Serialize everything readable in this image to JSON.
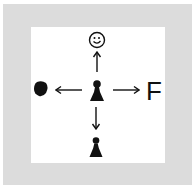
{
  "diagram": {
    "background_frame_color": "#dcdcdc",
    "inner_panel_color": "#ffffff",
    "ink_color": "#111111",
    "center": {
      "icon": "pawn-icon"
    },
    "directions": {
      "up": {
        "target_icon": "smiley-face-icon",
        "arrow": "arrow-up-icon"
      },
      "left": {
        "target_icon": "filled-blob-icon",
        "arrow": "arrow-left-icon"
      },
      "right": {
        "target_label": "F",
        "arrow": "arrow-right-icon"
      },
      "down": {
        "target_icon": "pawn-icon",
        "arrow": "arrow-down-icon"
      }
    }
  }
}
